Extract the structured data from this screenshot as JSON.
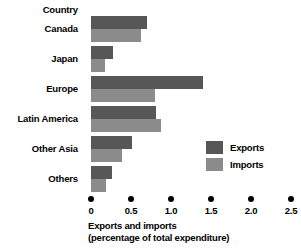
{
  "chart_data": {
    "type": "bar",
    "orientation": "horizontal",
    "title": "",
    "category_header": "Country",
    "categories": [
      "Canada",
      "Japan",
      "Europe",
      "Latin America",
      "Other Asia",
      "Others"
    ],
    "series": [
      {
        "name": "Exports",
        "color": "#575757",
        "values": [
          0.7,
          0.28,
          1.4,
          0.81,
          0.51,
          0.26
        ]
      },
      {
        "name": "Imports",
        "color": "#8b8b8b",
        "values": [
          0.63,
          0.18,
          0.8,
          0.88,
          0.39,
          0.19
        ]
      }
    ],
    "xlabel_line1": "Exports and imports",
    "xlabel_line2": "(percentage of total expenditure)",
    "ylabel": "Country",
    "xlim": [
      0,
      2.5
    ],
    "xticks": [
      0,
      0.5,
      1.0,
      1.5,
      2.0,
      2.5
    ],
    "xtick_labels": [
      "0",
      "0.5",
      "1.0",
      "1.5",
      "2.0",
      "2.5"
    ],
    "grid": false,
    "legend_position": "middle-right",
    "legend": [
      "Exports",
      "Imports"
    ]
  },
  "colors": {
    "exports": "#575757",
    "imports": "#8b8b8b",
    "background": "#ffffff",
    "text": "#000000"
  }
}
